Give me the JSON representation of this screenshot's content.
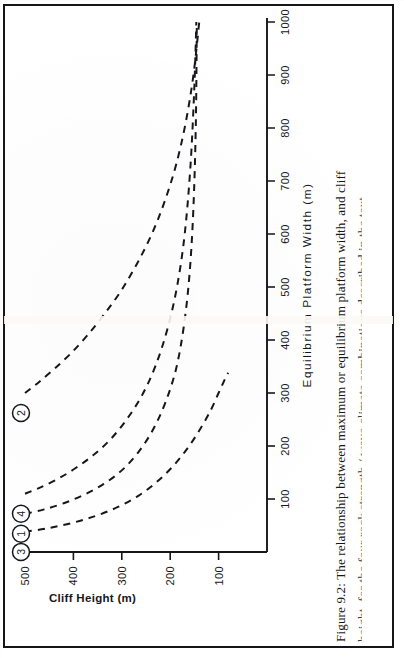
{
  "figure": {
    "caption_line1": "Figure 9.2:  The relationship between maximum or equilibrium platform width, and cliff",
    "caption_line2": "height, for the four rock strength / wave climate combinations described in the text.",
    "label": "Figure 9.2"
  },
  "chart_data": {
    "type": "line",
    "title": "",
    "xlabel": "Equilibrium  Platform  Width  (m)",
    "ylabel": "Cliff Height (m)",
    "xlim": [
      0,
      1000
    ],
    "ylim": [
      0,
      500
    ],
    "xticks": [
      100,
      200,
      300,
      400,
      500,
      600,
      700,
      800,
      900,
      1000
    ],
    "xticklabels": [
      "100",
      "200",
      "300",
      "400",
      "500",
      "600",
      "700",
      "800",
      "900",
      "1000"
    ],
    "yticks": [
      100,
      200,
      300,
      400,
      500
    ],
    "yticklabels": [
      "100",
      "200",
      "300",
      "400",
      "500"
    ],
    "grid": false,
    "legend": "inline-circled-markers",
    "linestyle": "dashed",
    "series": [
      {
        "name": "2",
        "marker_label": "2",
        "x": [
          300,
          320,
          345,
          375,
          410,
          450,
          495,
          545,
          600,
          660,
          730,
          810,
          900,
          1000
        ],
        "y": [
          500,
          472,
          440,
          405,
          370,
          335,
          300,
          268,
          238,
          212,
          188,
          168,
          152,
          140
        ]
      },
      {
        "name": "4",
        "marker_label": "4",
        "x": [
          110,
          122,
          138,
          158,
          182,
          212,
          250,
          296,
          352,
          420,
          500,
          600,
          730,
          880,
          1000
        ],
        "y": [
          500,
          468,
          432,
          396,
          360,
          324,
          290,
          258,
          230,
          206,
          186,
          170,
          158,
          150,
          146
        ]
      },
      {
        "name": "1",
        "marker_label": "1",
        "x": [
          72,
          80,
          92,
          108,
          128,
          154,
          188,
          230,
          282,
          345,
          425,
          525,
          650,
          810,
          1000
        ],
        "y": [
          500,
          462,
          420,
          378,
          338,
          300,
          266,
          236,
          210,
          188,
          172,
          160,
          152,
          147,
          145
        ]
      },
      {
        "name": "3",
        "marker_label": "3",
        "x": [
          38,
          45,
          55,
          68,
          85,
          106,
          132,
          162,
          196,
          232,
          268,
          300,
          320,
          332,
          338
        ],
        "y": [
          500,
          452,
          402,
          354,
          308,
          266,
          228,
          194,
          164,
          138,
          116,
          100,
          90,
          84,
          80
        ]
      }
    ]
  },
  "markers": [
    {
      "label": "2"
    },
    {
      "label": "4"
    },
    {
      "label": "1"
    },
    {
      "label": "3"
    }
  ]
}
